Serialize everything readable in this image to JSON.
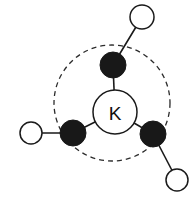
{
  "figure": {
    "center_atom": {
      "label": "K",
      "name": "potassium-center",
      "cx": 115,
      "cy": 112,
      "r": 22
    },
    "coordination_shell": {
      "name": "coordination-sphere",
      "cx": 112,
      "cy": 103,
      "r": 58,
      "style": "dashed"
    },
    "filled_atoms": [
      {
        "id": "filled-top",
        "cx": 113,
        "cy": 65,
        "r": 13
      },
      {
        "id": "filled-lower-left",
        "cx": 73,
        "cy": 133,
        "r": 13
      },
      {
        "id": "filled-lower-right",
        "cx": 153,
        "cy": 134,
        "r": 13
      }
    ],
    "open_atoms": [
      {
        "id": "open-top-right",
        "cx": 142,
        "cy": 17,
        "r": 12
      },
      {
        "id": "open-left",
        "cx": 31,
        "cy": 133,
        "r": 11
      },
      {
        "id": "open-bottom-right",
        "cx": 177,
        "cy": 180,
        "r": 11
      }
    ],
    "bonds": [
      {
        "id": "bond-center-top",
        "x1": 115,
        "y1": 112,
        "x2": 113,
        "y2": 65
      },
      {
        "id": "bond-center-lower-left",
        "x1": 115,
        "y1": 112,
        "x2": 73,
        "y2": 133
      },
      {
        "id": "bond-center-lower-right",
        "x1": 115,
        "y1": 112,
        "x2": 153,
        "y2": 134
      },
      {
        "id": "bond-top-outer",
        "x1": 113,
        "y1": 65,
        "x2": 142,
        "y2": 17
      },
      {
        "id": "bond-lower-left-outer",
        "x1": 73,
        "y1": 133,
        "x2": 31,
        "y2": 133
      },
      {
        "id": "bond-lower-right-outer",
        "x1": 153,
        "y1": 134,
        "x2": 177,
        "y2": 180
      }
    ],
    "colors": {
      "filled_atom": "#181818",
      "open_atom_fill": "#ffffff",
      "stroke": "#1a1a1a",
      "shell_stroke": "#2b2b2b",
      "background": "#ffffff"
    }
  }
}
